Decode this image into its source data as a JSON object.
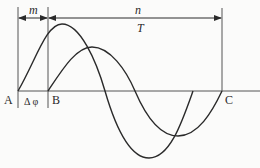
{
  "diagram": {
    "type": "phase-difference-waveforms",
    "labels": {
      "m": "m",
      "n": "n",
      "T": "T",
      "A": "A",
      "B": "B",
      "C": "C",
      "delta_phi": "Δ φ"
    },
    "colors": {
      "line": "#2a2a2a",
      "axis": "#555555",
      "background": "#fbfbfa"
    },
    "waves": [
      {
        "name": "reference-wave",
        "start": "A",
        "amplitude": "large"
      },
      {
        "name": "shifted-wave",
        "start": "B",
        "end": "C",
        "amplitude": "small"
      }
    ]
  }
}
